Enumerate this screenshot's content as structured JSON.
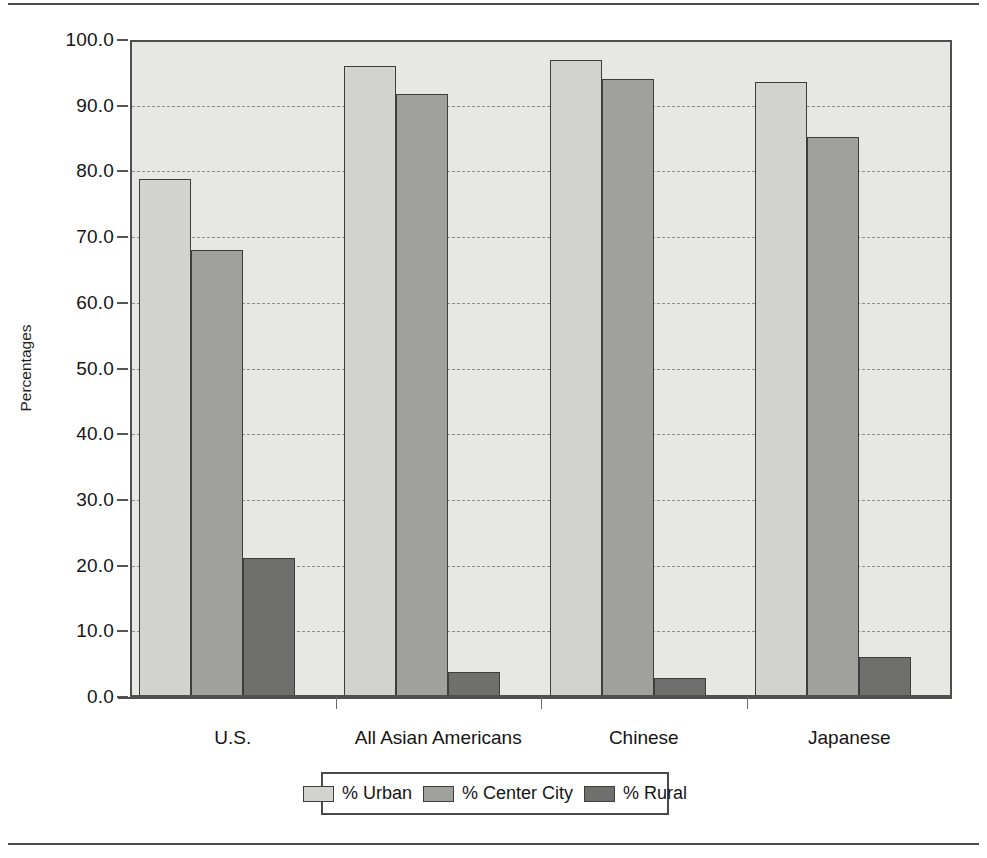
{
  "chart_data": {
    "type": "bar",
    "title": "",
    "subtitle": "",
    "xlabel": "",
    "ylabel": "Percentages",
    "ylim": [
      0,
      100
    ],
    "grid": true,
    "legend_position": "bottom",
    "categories": [
      "U.S.",
      "All Asian Americans",
      "Chinese",
      "Japanese"
    ],
    "ytick_labels": [
      "100.0",
      "90.0",
      "80.0",
      "70.0",
      "60.0",
      "50.0",
      "40.0",
      "30.0",
      "20.0",
      "10.0",
      "0.0"
    ],
    "ytick_values": [
      100,
      90,
      80,
      70,
      60,
      50,
      40,
      30,
      20,
      10,
      0
    ],
    "series": [
      {
        "name": "% Urban",
        "color": "#d2d2ce",
        "values": [
          79.0,
          96.3,
          97.3,
          93.9
        ]
      },
      {
        "name": "% Center City",
        "color": "#a0a09c",
        "values": [
          68.2,
          92.1,
          94.4,
          85.5
        ]
      },
      {
        "name": "% Rural",
        "color": "#6f6f6d",
        "values": [
          21.0,
          3.5,
          2.6,
          5.8
        ]
      }
    ]
  },
  "legend": {
    "items": [
      {
        "label": "% Urban",
        "swatch": "legend-swatch-urban"
      },
      {
        "label": "% Center City",
        "swatch": "legend-swatch-center-city"
      },
      {
        "label": "% Rural",
        "swatch": "legend-swatch-rural"
      }
    ]
  },
  "axes": {
    "y_title": "Percentages"
  }
}
